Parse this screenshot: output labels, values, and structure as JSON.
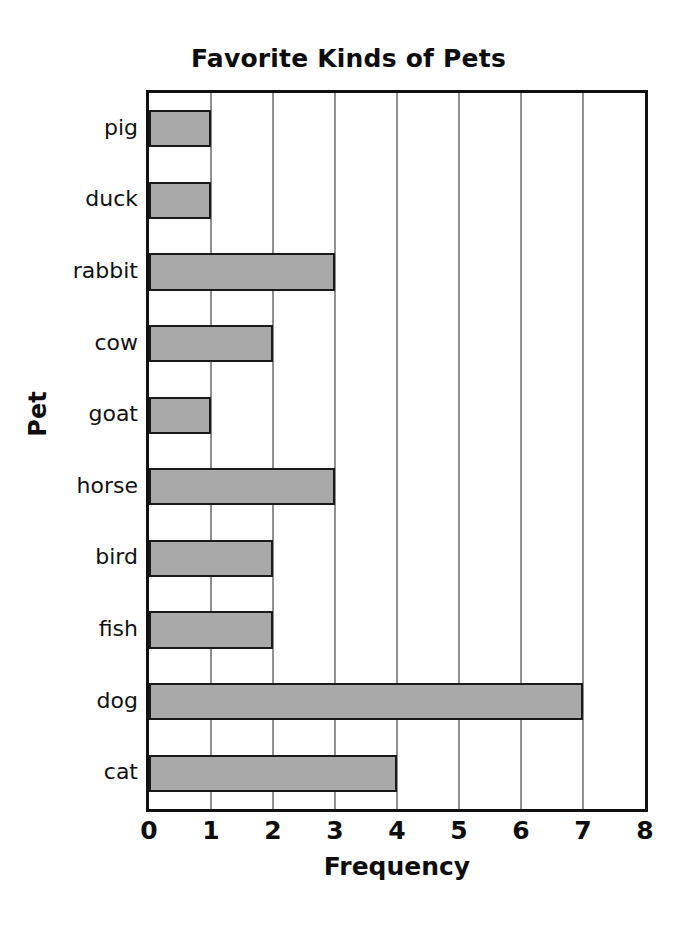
{
  "chart_data": {
    "type": "bar",
    "orientation": "horizontal",
    "title": "Favorite Kinds of Pets",
    "xlabel": "Frequency",
    "ylabel": "Pet",
    "categories": [
      "pig",
      "duck",
      "rabbit",
      "cow",
      "goat",
      "horse",
      "bird",
      "fish",
      "dog",
      "cat"
    ],
    "values": [
      1,
      1,
      3,
      2,
      1,
      3,
      2,
      2,
      7,
      4
    ],
    "xlim": [
      0,
      8
    ],
    "xticks": [
      "0",
      "1",
      "2",
      "3",
      "4",
      "5",
      "6",
      "7",
      "8"
    ],
    "grid": "vertical",
    "legend": "none",
    "bar_fill_color": "#a9a9a9",
    "bar_border_color": "#1a1a1a",
    "axis_color": "#111111",
    "gridline_color": "#8f8f8f"
  }
}
